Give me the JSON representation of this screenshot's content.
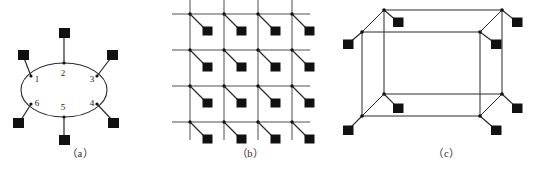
{
  "figure": {
    "background_color": "#ffffff",
    "ink_color": "#1a1a1a",
    "node_color": "#111111",
    "width": 553,
    "height": 170
  },
  "panels": [
    {
      "id": "a",
      "caption": "（a）",
      "type": "ring-topology",
      "description": "Ellipse ring with six numbered attachment points, each connected by a short stub to a filled square node",
      "ellipse": {
        "cx": 64,
        "cy": 90,
        "rx": 43,
        "ry": 27
      },
      "index_labels": [
        "1",
        "2",
        "3",
        "4",
        "5",
        "6"
      ],
      "attachment_points": [
        {
          "label": "1",
          "label_x": 37,
          "label_y": 79,
          "ring_x": 31,
          "ring_y": 76,
          "sq_x": 22,
          "sq_y": 54
        },
        {
          "label": "2",
          "label_x": 63,
          "label_y": 73,
          "ring_x": 64,
          "ring_y": 63,
          "sq_x": 64,
          "sq_y": 32
        },
        {
          "label": "3",
          "label_x": 92,
          "label_y": 79,
          "ring_x": 97,
          "ring_y": 76,
          "sq_x": 113,
          "sq_y": 54
        },
        {
          "label": "4",
          "label_x": 92,
          "label_y": 103,
          "ring_x": 97,
          "ring_y": 104,
          "sq_x": 113,
          "sq_y": 122
        },
        {
          "label": "5",
          "label_x": 63,
          "label_y": 107,
          "ring_x": 64,
          "ring_y": 117,
          "sq_x": 64,
          "sq_y": 140
        },
        {
          "label": "6",
          "label_x": 37,
          "label_y": 103,
          "ring_x": 31,
          "ring_y": 104,
          "sq_x": 18,
          "sq_y": 122
        }
      ]
    },
    {
      "id": "b",
      "caption": "（b）",
      "type": "mesh-grid-topology",
      "description": "Four by four square lattice of crossing lines; every intersection has a diagonal stub down-right to a filled square node",
      "rows": 4,
      "cols": 4,
      "origin_x": 30,
      "origin_y": 14,
      "spacing_x": 34,
      "spacing_y": 36,
      "line_overhang": 18,
      "stub_dx": 17,
      "stub_dy": 17
    },
    {
      "id": "c",
      "caption": "（c）",
      "type": "cube-hypercube-topology",
      "description": "Wireframe rectangular box drawn in oblique projection with eight vertices, each carrying a stub to a filled square node",
      "front": {
        "x": 22,
        "y": 32,
        "w": 118,
        "h": 84
      },
      "depth_dx": -22,
      "depth_dy": 22,
      "vertices": [
        {
          "name": "front-top-left",
          "x": 22,
          "y": 32,
          "sq_x": 8,
          "sq_y": 44
        },
        {
          "name": "front-top-right",
          "x": 140,
          "y": 32,
          "sq_x": 156,
          "sq_y": 44
        },
        {
          "name": "front-bottom-left",
          "x": 22,
          "y": 116,
          "sq_x": 8,
          "sq_y": 130
        },
        {
          "name": "front-bottom-right",
          "x": 140,
          "y": 116,
          "sq_x": 156,
          "sq_y": 130
        },
        {
          "name": "back-top-left",
          "x": 44,
          "y": 10,
          "sq_x": 58,
          "sq_y": 22
        },
        {
          "name": "back-top-right",
          "x": 162,
          "y": 10,
          "sq_x": 177,
          "sq_y": 22
        },
        {
          "name": "back-bottom-left",
          "x": 44,
          "y": 94,
          "sq_x": 58,
          "sq_y": 108
        },
        {
          "name": "back-bottom-right",
          "x": 162,
          "y": 94,
          "sq_x": 177,
          "sq_y": 108
        }
      ]
    }
  ]
}
